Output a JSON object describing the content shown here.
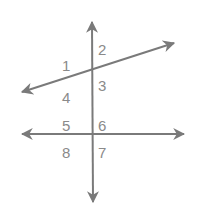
{
  "diagram": {
    "line_color": "#7a7a7a",
    "label_color": "#8a8a8a",
    "angles": [
      {
        "id": "1",
        "label": "1",
        "x": 62,
        "y": 58
      },
      {
        "id": "2",
        "label": "2",
        "x": 98,
        "y": 42
      },
      {
        "id": "3",
        "label": "3",
        "x": 98,
        "y": 78
      },
      {
        "id": "4",
        "label": "4",
        "x": 62,
        "y": 90
      },
      {
        "id": "5",
        "label": "5",
        "x": 62,
        "y": 118
      },
      {
        "id": "6",
        "label": "6",
        "x": 98,
        "y": 118
      },
      {
        "id": "7",
        "label": "7",
        "x": 98,
        "y": 145
      },
      {
        "id": "8",
        "label": "8",
        "x": 62,
        "y": 145
      }
    ]
  }
}
